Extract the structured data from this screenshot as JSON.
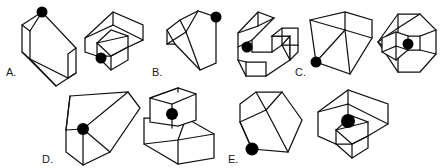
{
  "sheet": {
    "title": "Spatial reasoning item set",
    "width": 446,
    "height": 168,
    "background_color": "#ffffff",
    "line_color": "#111111",
    "marker_color": "#000000",
    "label_color": "#1a1a1a"
  },
  "items": [
    {
      "id": "a",
      "label": "A.",
      "label_x": 6,
      "label_y": 76,
      "left_figure": {
        "name": "wedge-block-left",
        "marker": {
          "cx": 42,
          "cy": 12,
          "r": 5.5
        },
        "paths": [
          "M 22 25 L 42 12 L 76 48 L 76 73 L 56 86 L 22 52 Z",
          "M 22 25 L 30 31 L 30 59 L 22 52",
          "M 30 31 L 42 12",
          "M 30 59 L 56 86",
          "M 30 59 L 68 78 L 76 73",
          "M 68 78 L 68 54 L 76 48",
          "M 56 86 L 68 78"
        ]
      },
      "right_figure": {
        "name": "notched-slab-right",
        "marker": {
          "cx": 105,
          "cy": 60,
          "r": 5.5
        },
        "paths": [
          "M 85 38 L 113 12 L 143 25 L 143 40 L 128 47 L 128 36 L 111 30 L 97 43 L 97 56 L 85 52 Z",
          "M 85 38 L 113 12",
          "M 113 12 L 113 25 L 85 38",
          "M 113 25 L 143 40",
          "M 97 43 L 128 36",
          "M 97 56 L 111 70 L 128 60 L 128 47",
          "M 111 70 L 111 56 L 97 43",
          "M 111 56 L 128 47",
          "M 97 56 L 85 52"
        ]
      }
    },
    {
      "id": "b",
      "label": "B.",
      "label_x": 152,
      "label_y": 76,
      "left_figure": {
        "name": "slanted-prism-left",
        "marker": {
          "cx": 216,
          "cy": 17,
          "r": 5.5
        },
        "paths": [
          "M 167 30 L 180 20 L 198 11 L 216 17 L 216 63 L 200 70 L 175 44 Z",
          "M 167 30 L 180 20",
          "M 180 20 L 186 32 L 167 44 L 167 30",
          "M 186 32 L 198 11",
          "M 186 32 L 200 70",
          "M 167 44 L 175 44"
        ]
      },
      "right_figure": {
        "name": "l-frame-with-cube-right",
        "marker": {
          "cx": 247,
          "cy": 47,
          "r": 5.5
        },
        "paths": [
          "M 238 33 L 258 12 L 274 18 L 252 40 L 252 52 L 272 52 L 272 36 L 290 36 L 290 60 L 266 76 L 246 76 L 238 60 Z",
          "M 238 33 L 238 60",
          "M 258 12 L 258 26 L 238 33",
          "M 258 26 L 274 18",
          "M 252 40 L 238 47",
          "M 272 36 L 282 28 L 298 28 L 290 36",
          "M 298 28 L 298 52 L 290 60",
          "M 272 52 L 282 45 L 298 45",
          "M 282 45 L 282 28",
          "M 246 76 L 246 62 L 238 60",
          "M 246 62 L 266 62 L 266 76"
        ]
      }
    },
    {
      "id": "c",
      "label": "C.",
      "label_x": 295,
      "label_y": 76,
      "left_figure": {
        "name": "tilted-wedge-left",
        "marker": {
          "cx": 316,
          "cy": 62,
          "r": 5.5
        },
        "paths": [
          "M 310 20 L 345 12 L 372 20 L 372 38 L 345 55 L 350 74 L 316 62 Z",
          "M 310 20 L 345 12",
          "M 345 12 L 345 30 L 310 20",
          "M 345 30 L 372 38",
          "M 345 30 L 316 62",
          "M 345 30 L 350 74"
        ]
      },
      "right_figure": {
        "name": "arrow-frame-with-cube-right",
        "marker": {
          "cx": 406,
          "cy": 44,
          "r": 5.5
        },
        "paths": [
          "M 378 42 L 398 14 L 420 14 L 404 36 L 404 50 L 420 72 L 398 72 Z",
          "M 398 14 L 398 28 L 378 42",
          "M 398 28 L 420 14",
          "M 398 28 L 398 58 L 378 42",
          "M 398 58 L 398 72",
          "M 420 14 L 436 30 L 436 54 L 420 72",
          "M 404 36 L 420 36 L 436 30",
          "M 404 50 L 420 50 L 436 54",
          "M 420 36 L 420 50",
          "M 382 38 L 382 52 L 396 60",
          "M 382 38 L 396 32 L 408 36",
          "M 396 32 L 396 46 L 382 52",
          "M 396 46 L 408 50",
          "M 396 60 L 396 46"
        ]
      }
    },
    {
      "id": "d",
      "label": "D.",
      "label_x": 42,
      "label_y": 163,
      "left_figure": {
        "name": "flat-plate-left",
        "marker": {
          "cx": 83,
          "cy": 129,
          "r": 6.0
        },
        "paths": [
          "M 70 96 L 128 92 L 140 108 L 110 152 L 83 165 L 66 152 L 66 130 Z",
          "M 70 96 L 66 130",
          "M 66 130 L 83 129 L 128 92",
          "M 83 129 L 110 152",
          "M 83 129 L 83 165"
        ]
      },
      "right_figure": {
        "name": "stepped-block-right",
        "marker": {
          "cx": 172,
          "cy": 114,
          "r": 6.0
        },
        "paths": [
          "M 150 122 L 196 94 L 196 120",
          "M 148 120 L 184 98 L 184 128",
          "M 150 122 L 150 98 L 178 88 L 196 94",
          "M 150 98 L 178 88",
          "M 178 88 L 178 112",
          "M 146 118 L 184 98",
          "M 146 118 L 178 112 L 196 120 L 196 94",
          "M 178 112 L 150 122",
          "M 144 118 L 186 118 L 214 134 L 214 158 L 178 164 L 144 144 Z",
          "M 144 118 L 186 118",
          "M 186 118 L 178 140 L 144 144",
          "M 178 140 L 178 164",
          "M 178 140 L 214 134"
        ]
      }
    },
    {
      "id": "e",
      "label": "E.",
      "label_x": 228,
      "label_y": 163,
      "left_figure": {
        "name": "tilted-slab-left",
        "marker": {
          "cx": 252,
          "cy": 149,
          "r": 6.5
        },
        "paths": [
          "M 240 104 L 256 92 L 282 92 L 302 120 L 288 152 L 252 149 L 240 122 Z",
          "M 240 104 L 256 92",
          "M 256 92 L 266 110 L 240 122 L 240 104",
          "M 266 110 L 282 92",
          "M 266 110 L 288 152",
          "M 240 122 L 252 149"
        ]
      },
      "right_figure": {
        "name": "notched-slab-right-e",
        "marker": {
          "cx": 348,
          "cy": 121,
          "r": 7.0
        },
        "paths": [
          "M 318 112 L 348 90 L 388 104 L 388 124 L 368 136 L 368 122 L 352 116 L 336 130 L 336 144 L 318 136 Z",
          "M 318 112 L 348 90",
          "M 348 90 L 348 104 L 318 112",
          "M 348 104 L 388 124",
          "M 336 130 L 368 122",
          "M 336 144 L 352 158 L 368 148 L 368 136",
          "M 352 158 L 352 144 L 336 130",
          "M 352 144 L 368 136",
          "M 348 104 L 348 121"
        ]
      }
    },
    {
      "id": "f",
      "label": "F.",
      "label_x": 228,
      "label_y": 163,
      "visible": false
    }
  ]
}
